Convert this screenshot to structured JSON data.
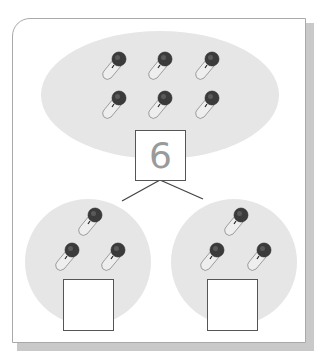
{
  "worksheet": {
    "type": "number bond (part-part-whole)",
    "item_icon": "microphone-icon",
    "whole": {
      "value": "6",
      "item_count": 6
    },
    "parts": [
      {
        "position": "left",
        "item_count": 3,
        "value": ""
      },
      {
        "position": "right",
        "item_count": 3,
        "value": ""
      }
    ]
  },
  "colors": {
    "bubble_fill": "#e6e6e6",
    "box_border": "#555555",
    "number_text": "#9a9a9a",
    "frame_border": "#a9a9a9",
    "frame_shadow": "#c9c9c9",
    "mic_head": "#3a3a3a",
    "mic_handle": "#f2f2f2"
  }
}
